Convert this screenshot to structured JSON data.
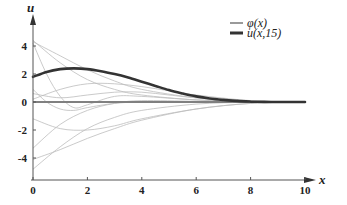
{
  "chart_data": {
    "type": "line",
    "title": "",
    "xlabel": "x",
    "ylabel": "u",
    "xlim": [
      0,
      10
    ],
    "ylim": [
      -5.5,
      5.5
    ],
    "grid": false,
    "legend_position": "top-right",
    "x_ticks": [
      0,
      2,
      4,
      6,
      8,
      10
    ],
    "y_ticks": [
      -4,
      -2,
      0,
      2,
      4
    ],
    "x_tick_labels": [
      "0",
      "2",
      "4",
      "6",
      "8",
      "10"
    ],
    "y_tick_labels": [
      "-4",
      "-2",
      "0",
      "2",
      "4"
    ],
    "legend": [
      {
        "label": "φ(x)",
        "color": "#9a9a9a",
        "style": "thin gray"
      },
      {
        "label": "u(x,15)",
        "color": "#333333",
        "style": "thick dark"
      }
    ],
    "series": [
      {
        "name": "u(x,15)",
        "color": "#333333",
        "x": [
          0,
          0.5,
          1,
          1.5,
          2,
          2.5,
          3,
          3.5,
          4,
          4.5,
          5,
          5.5,
          6,
          6.5,
          7,
          7.5,
          8,
          8.5,
          9,
          9.5,
          10
        ],
        "values": [
          1.8,
          2.15,
          2.35,
          2.4,
          2.35,
          2.2,
          2.0,
          1.75,
          1.45,
          1.15,
          0.85,
          0.6,
          0.4,
          0.25,
          0.15,
          0.08,
          0.03,
          0.01,
          0.0,
          0.0,
          0.0
        ]
      },
      {
        "name": "φ(x)",
        "color": "#9a9a9a",
        "note": "family of thin gray initial-data curves converging to 0 as x→10",
        "curves": [
          {
            "x": [
              0,
              1,
              2,
              3,
              4,
              6,
              8,
              10
            ],
            "values": [
              4.4,
              2.8,
              1.6,
              0.9,
              0.5,
              0.15,
              0.03,
              0
            ]
          },
          {
            "x": [
              0,
              1,
              2,
              3,
              4,
              6,
              8,
              10
            ],
            "values": [
              4.3,
              3.3,
              2.3,
              1.5,
              0.9,
              0.3,
              0.06,
              0
            ]
          },
          {
            "x": [
              0,
              0.5,
              1,
              1.5,
              2,
              3,
              4,
              6,
              8,
              10
            ],
            "values": [
              4.2,
              2.0,
              0.4,
              -0.4,
              -0.2,
              0.4,
              0.4,
              0.15,
              0.03,
              0
            ]
          },
          {
            "x": [
              0,
              1,
              2,
              3,
              4,
              5,
              6,
              8,
              10
            ],
            "values": [
              0.2,
              0.9,
              1.3,
              1.3,
              1.1,
              0.8,
              0.5,
              0.1,
              0
            ]
          },
          {
            "x": [
              0,
              1,
              2,
              3,
              4,
              5,
              6,
              8,
              10
            ],
            "values": [
              0.6,
              0.3,
              0.5,
              0.7,
              0.7,
              0.5,
              0.3,
              0.05,
              0
            ]
          },
          {
            "x": [
              0,
              1,
              2,
              3,
              4,
              6,
              8,
              10
            ],
            "values": [
              -1.2,
              -1.9,
              -2.0,
              -1.7,
              -1.2,
              -0.5,
              -0.1,
              0
            ]
          },
          {
            "x": [
              0,
              1,
              2,
              3,
              4,
              6,
              8,
              10
            ],
            "values": [
              -3.3,
              -1.6,
              -0.6,
              -0.1,
              0.1,
              0.05,
              0.01,
              0
            ]
          },
          {
            "x": [
              0,
              1,
              2,
              3,
              4,
              6,
              8,
              10
            ],
            "values": [
              -4.1,
              -3.4,
              -2.6,
              -1.9,
              -1.3,
              -0.5,
              -0.1,
              0
            ]
          },
          {
            "x": [
              0,
              1,
              2,
              3,
              4,
              6,
              8,
              10
            ],
            "values": [
              -4.8,
              -3.2,
              -1.9,
              -1.1,
              -0.6,
              -0.15,
              -0.02,
              0
            ]
          },
          {
            "x": [
              0,
              0.5,
              1,
              1.5,
              2,
              3,
              4,
              6,
              8,
              10
            ],
            "values": [
              0.9,
              0.0,
              -0.5,
              -0.6,
              -0.4,
              -0.1,
              0.0,
              0.0,
              0.0,
              0
            ]
          }
        ]
      },
      {
        "name": "zero line",
        "color": "#777777",
        "x": [
          0,
          10
        ],
        "values": [
          0,
          0
        ]
      }
    ]
  }
}
